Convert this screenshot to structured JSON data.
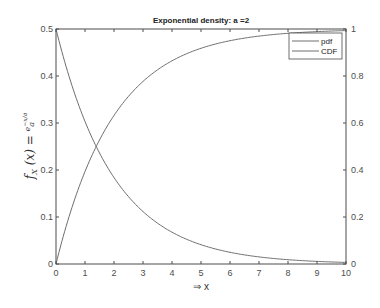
{
  "chart_data": {
    "type": "line",
    "title": "Exponential density: a =2",
    "xlabel": "⇒ x",
    "ylabel": "f_X(x) = e^(-x/a)/a",
    "ylabel_display": "fₓ (x) = e⁻ˣᐟᵃ / a",
    "xlim": [
      0,
      10
    ],
    "ylim_left": [
      0,
      0.5
    ],
    "ylim_right": [
      0,
      1
    ],
    "xticks": [
      "0",
      "1",
      "2",
      "3",
      "4",
      "5",
      "6",
      "7",
      "8",
      "9",
      "10"
    ],
    "yticks_left": [
      "0",
      "0.1",
      "0.2",
      "0.3",
      "0.4",
      "0.5"
    ],
    "yticks_right": [
      "0",
      "0.2",
      "0.4",
      "0.6",
      "0.8",
      "1"
    ],
    "grid": false,
    "legend_position": "top-right",
    "parameter_a": 2,
    "series": [
      {
        "name": "pdf",
        "axis": "left",
        "formula": "exp(-x/2)/2",
        "x": [
          0,
          1,
          2,
          3,
          4,
          5,
          6,
          7,
          8,
          9,
          10
        ],
        "values": [
          0.5,
          0.303,
          0.184,
          0.112,
          0.068,
          0.041,
          0.025,
          0.015,
          0.009,
          0.006,
          0.003
        ]
      },
      {
        "name": "CDF",
        "axis": "right",
        "formula": "1-exp(-x/2)",
        "x": [
          0,
          1,
          2,
          3,
          4,
          5,
          6,
          7,
          8,
          9,
          10
        ],
        "values": [
          0,
          0.393,
          0.632,
          0.777,
          0.865,
          0.918,
          0.95,
          0.97,
          0.982,
          0.989,
          0.993
        ]
      }
    ],
    "colors": {
      "axis": "#4d4d4d",
      "line": "#6e6e6e"
    }
  }
}
